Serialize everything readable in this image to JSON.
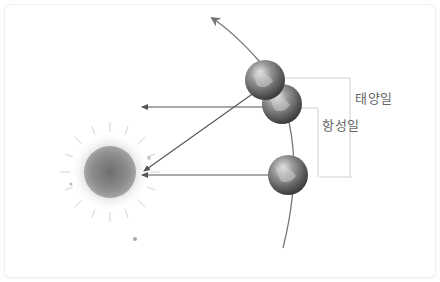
{
  "labels": {
    "solar_day": "태양일",
    "sidereal_day": "항성일"
  },
  "elements": {
    "sun": "sun",
    "earth_positions": [
      "earth-position-1",
      "earth-position-2",
      "earth-position-3"
    ],
    "orbit": "orbit-arc",
    "distant_star_direction": "parallel-arrows-to-distant-star",
    "sun_direction": "arrow-to-sun"
  },
  "colors": {
    "arrow": "#555555",
    "orbit": "#777777",
    "bracket": "#cccccc",
    "label_text": "#666666",
    "sun_fill": "#8a8a8a",
    "earth_fill": "#6a6a6a"
  }
}
